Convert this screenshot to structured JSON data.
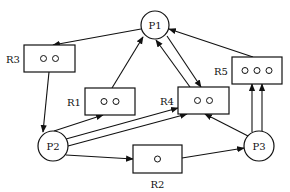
{
  "diagram": {
    "title": "",
    "processes": [
      {
        "id": "P1",
        "label": "P1",
        "cx": 155,
        "cy": 25,
        "r": 14
      },
      {
        "id": "P2",
        "label": "P2",
        "cx": 53,
        "cy": 146,
        "r": 15
      },
      {
        "id": "P3",
        "label": "P3",
        "cx": 259,
        "cy": 146,
        "r": 15
      }
    ],
    "resources": [
      {
        "id": "R1",
        "label": "R1",
        "instances": 2,
        "x": 85,
        "y": 88,
        "w": 50,
        "h": 27,
        "label_pos": "left"
      },
      {
        "id": "R2",
        "label": "R2",
        "instances": 1,
        "x": 133,
        "y": 145,
        "w": 49,
        "h": 28,
        "label_pos": "below"
      },
      {
        "id": "R3",
        "label": "R3",
        "instances": 2,
        "x": 24,
        "y": 45,
        "w": 51,
        "h": 27,
        "label_pos": "left"
      },
      {
        "id": "R4",
        "label": "R4",
        "instances": 2,
        "x": 178,
        "y": 87,
        "w": 51,
        "h": 27,
        "label_pos": "left"
      },
      {
        "id": "R5",
        "label": "R5",
        "instances": 3,
        "x": 232,
        "y": 57,
        "w": 50,
        "h": 27,
        "label_pos": "left"
      }
    ],
    "edges": [
      {
        "from": "P1",
        "to": "R3",
        "x1": 141,
        "y1": 29,
        "x2": 53,
        "y2": 45
      },
      {
        "from": "R1",
        "to": "P1",
        "x1": 112,
        "y1": 88,
        "x2": 143,
        "y2": 37
      },
      {
        "from": "R4",
        "to": "P1",
        "x1": 190,
        "y1": 87,
        "x2": 156,
        "y2": 40
      },
      {
        "from": "P1",
        "to": "R4",
        "x1": 167,
        "y1": 36,
        "x2": 201,
        "y2": 87
      },
      {
        "from": "R5",
        "to": "P1",
        "x1": 253,
        "y1": 57,
        "x2": 169,
        "y2": 29
      },
      {
        "from": "R3",
        "to": "P2",
        "x1": 49,
        "y1": 72,
        "x2": 43,
        "y2": 132
      },
      {
        "from": "P2",
        "to": "R1",
        "x1": 54,
        "y1": 131,
        "x2": 103,
        "y2": 115
      },
      {
        "from": "P2",
        "to": "R4",
        "x1": 66,
        "y1": 139,
        "x2": 178,
        "y2": 108
      },
      {
        "from": "P2",
        "to": "R4",
        "x1": 68,
        "y1": 146,
        "x2": 187,
        "y2": 114
      },
      {
        "from": "P2",
        "to": "R2",
        "x1": 66,
        "y1": 155,
        "x2": 133,
        "y2": 159
      },
      {
        "from": "R2",
        "to": "P3",
        "x1": 182,
        "y1": 158,
        "x2": 244,
        "y2": 148
      },
      {
        "from": "P3",
        "to": "R4",
        "x1": 248,
        "y1": 136,
        "x2": 205,
        "y2": 114
      },
      {
        "from": "P3",
        "to": "R5",
        "x1": 252,
        "y1": 132,
        "x2": 252,
        "y2": 84
      },
      {
        "from": "P3",
        "to": "R5",
        "x1": 262,
        "y1": 131,
        "x2": 262,
        "y2": 84
      }
    ]
  }
}
